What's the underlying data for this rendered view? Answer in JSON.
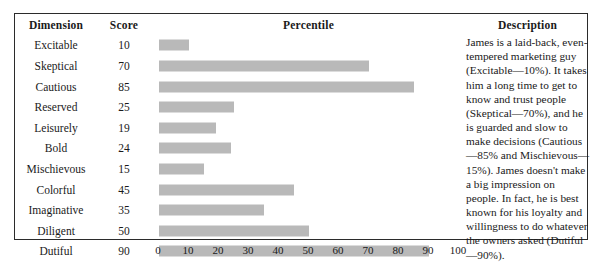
{
  "table": {
    "headers": {
      "dimension": "Dimension",
      "score": "Score",
      "percentile": "Percentile",
      "description": "Description"
    },
    "rows": [
      {
        "dimension": "Excitable",
        "score": 10
      },
      {
        "dimension": "Skeptical",
        "score": 70
      },
      {
        "dimension": "Cautious",
        "score": 85
      },
      {
        "dimension": "Reserved",
        "score": 25
      },
      {
        "dimension": "Leisurely",
        "score": 19
      },
      {
        "dimension": "Bold",
        "score": 24
      },
      {
        "dimension": "Mischievous",
        "score": 15
      },
      {
        "dimension": "Colorful",
        "score": 45
      },
      {
        "dimension": "Imaginative",
        "score": 35
      },
      {
        "dimension": "Diligent",
        "score": 50
      },
      {
        "dimension": "Dutiful",
        "score": 90
      }
    ],
    "description": "James is a laid-back, even-tempered marketing guy (Excitable—10%). It takes him a long time to get to know and trust people (Skeptical—70%), and he is guarded and slow to make decisions (Cautious—85% and Mischievous—15%). James doesn't make a big impression on people. In fact, he is best known for his loyalty and willingness to do whatever the owners asked (Dutiful—90%)."
  },
  "axis": {
    "ticks": [
      0,
      10,
      20,
      30,
      40,
      50,
      60,
      70,
      80,
      90,
      100
    ],
    "min": 0,
    "max": 100
  },
  "colors": {
    "bar": "#b9b9b9",
    "rule": "#2b2b2b",
    "background": "#ffffff",
    "text": "#1a1a1a"
  },
  "chart_data": {
    "type": "bar",
    "orientation": "horizontal",
    "title": "Percentile",
    "xlabel": "",
    "ylabel": "Dimension",
    "categories": [
      "Excitable",
      "Skeptical",
      "Cautious",
      "Reserved",
      "Leisurely",
      "Bold",
      "Mischievous",
      "Colorful",
      "Imaginative",
      "Diligent",
      "Dutiful"
    ],
    "values": [
      10,
      70,
      85,
      25,
      19,
      24,
      15,
      45,
      35,
      50,
      90
    ],
    "xlim": [
      0,
      100
    ],
    "xticks": [
      0,
      10,
      20,
      30,
      40,
      50,
      60,
      70,
      80,
      90,
      100
    ],
    "grid": false,
    "legend": false,
    "bar_color": "#b9b9b9"
  }
}
